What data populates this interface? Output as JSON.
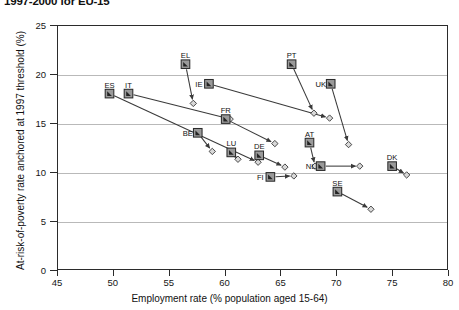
{
  "title": "1997-2000 for EU-15",
  "axes": {
    "x_title": "Employment rate (% population aged 15-64)",
    "y_title": "At-risk-of-poverty rate anchored at 1997 threshold (%)",
    "x_ticks": [
      "45",
      "50",
      "55",
      "60",
      "65",
      "70",
      "75",
      "80"
    ],
    "y_ticks": [
      "0",
      "5",
      "10",
      "15",
      "20",
      "25"
    ]
  },
  "colors": {
    "frame": "#2b2b2b",
    "grid": "#b9b9b9",
    "marker_fill": "#9a9a9a",
    "marker_stroke": "#2b2b2b",
    "arrow": "#3a3a3a",
    "end_marker_fill": "#d8d8d8"
  },
  "chart_data": {
    "type": "scatter",
    "title": "1997-2000 for EU-15",
    "xlabel": "Employment rate (% population aged 15-64)",
    "ylabel": "At-risk-of-poverty rate anchored at 1997 threshold (%)",
    "xlim": [
      45,
      80
    ],
    "ylim": [
      0,
      25
    ],
    "xticks": [
      45,
      50,
      55,
      60,
      65,
      70,
      75,
      80
    ],
    "yticks": [
      0,
      5,
      10,
      15,
      20,
      25
    ],
    "grid": "horizontal",
    "legend": "none",
    "note": "Each country is an arrow from its 1997 position (square marker) to its 2000 position (diamond marker).",
    "series": [
      {
        "name": "ES",
        "label_dx": 0,
        "label_dy": -9,
        "start": {
          "x": 49.7,
          "y": 18.0
        },
        "end": {
          "x": 63.0,
          "y": 11.0
        }
      },
      {
        "name": "IT",
        "label_dx": 0,
        "label_dy": -9,
        "start": {
          "x": 51.4,
          "y": 18.0
        },
        "end": {
          "x": 60.5,
          "y": 15.4
        }
      },
      {
        "name": "EL",
        "label_dx": 0,
        "label_dy": -9,
        "start": {
          "x": 56.5,
          "y": 21.0
        },
        "end": {
          "x": 57.2,
          "y": 17.0
        }
      },
      {
        "name": "BE",
        "label_dx": -10,
        "label_dy": 0,
        "start": {
          "x": 57.6,
          "y": 14.0
        },
        "end": {
          "x": 58.9,
          "y": 12.1
        }
      },
      {
        "name": "IE",
        "label_dx": -10,
        "label_dy": 0,
        "start": {
          "x": 58.6,
          "y": 19.0
        },
        "end": {
          "x": 69.4,
          "y": 15.5
        }
      },
      {
        "name": "FR",
        "label_dx": 0,
        "label_dy": -9,
        "start": {
          "x": 60.1,
          "y": 15.4
        },
        "end": {
          "x": 64.5,
          "y": 12.9
        }
      },
      {
        "name": "LU",
        "label_dx": 0,
        "label_dy": -9,
        "start": {
          "x": 60.6,
          "y": 12.0
        },
        "end": {
          "x": 61.2,
          "y": 11.3
        }
      },
      {
        "name": "DE",
        "label_dx": 0,
        "label_dy": -9,
        "start": {
          "x": 63.1,
          "y": 11.7
        },
        "end": {
          "x": 65.4,
          "y": 10.5
        }
      },
      {
        "name": "FI",
        "label_dx": -10,
        "label_dy": 0,
        "start": {
          "x": 64.1,
          "y": 9.5
        },
        "end": {
          "x": 66.2,
          "y": 9.6
        }
      },
      {
        "name": "PT",
        "label_dx": 0,
        "label_dy": -9,
        "start": {
          "x": 66.0,
          "y": 21.0
        },
        "end": {
          "x": 68.0,
          "y": 16.0
        }
      },
      {
        "name": "AT",
        "label_dx": 0,
        "label_dy": -9,
        "start": {
          "x": 67.6,
          "y": 13.0
        },
        "end": {
          "x": 68.1,
          "y": 10.6
        }
      },
      {
        "name": "NL",
        "label_dx": -10,
        "label_dy": 0,
        "start": {
          "x": 68.6,
          "y": 10.6
        },
        "end": {
          "x": 72.1,
          "y": 10.6
        }
      },
      {
        "name": "UK",
        "label_dx": -10,
        "label_dy": 0,
        "start": {
          "x": 69.5,
          "y": 19.0
        },
        "end": {
          "x": 71.1,
          "y": 12.8
        }
      },
      {
        "name": "SE",
        "label_dx": 0,
        "label_dy": -9,
        "start": {
          "x": 70.1,
          "y": 8.0
        },
        "end": {
          "x": 73.1,
          "y": 6.2
        }
      },
      {
        "name": "DK",
        "label_dx": 0,
        "label_dy": -9,
        "start": {
          "x": 75.0,
          "y": 10.6
        },
        "end": {
          "x": 76.3,
          "y": 9.7
        }
      }
    ]
  }
}
